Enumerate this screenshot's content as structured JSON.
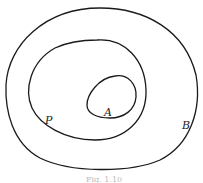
{
  "diagram": {
    "type": "nested-regions",
    "labels": {
      "inner": "A",
      "middle": "P",
      "outer": "B"
    },
    "caption": "Fig. 1.10",
    "stroke_color": "#1a1a1a",
    "background": "#ffffff"
  }
}
